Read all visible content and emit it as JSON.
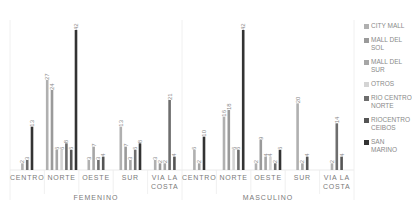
{
  "chart_data": {
    "type": "bar",
    "title": "",
    "xlabel": "",
    "ylabel": "",
    "ylim": [
      0,
      45
    ],
    "grid": false,
    "legend_position": "right",
    "groups": [
      "FEMENINO",
      "MASCULINO"
    ],
    "categories": [
      "CENTRO",
      "NORTE",
      "OESTE",
      "SUR",
      "VIA LA COSTA"
    ],
    "series": [
      {
        "name": "CITY MALL",
        "color": "#b0b0b0",
        "values": {
          "FEMENINO": [
            2,
            27,
            3,
            13,
            3
          ],
          "MASCULINO": [
            6,
            16,
            2,
            20,
            2
          ]
        }
      },
      {
        "name": "MALL DEL SOL",
        "color": "#9a9a9a",
        "values": {
          "FEMENINO": [
            0,
            24,
            0,
            7,
            2
          ],
          "MASCULINO": [
            0,
            18,
            9,
            0,
            0
          ]
        }
      },
      {
        "name": "MALL DEL SUR",
        "color": "#a6a6a6",
        "values": {
          "FEMENINO": [
            0,
            6,
            7,
            3,
            2
          ],
          "MASCULINO": [
            2,
            0,
            4,
            2,
            0
          ]
        }
      },
      {
        "name": "OTROS",
        "color": "#d4d4d4",
        "values": {
          "FEMENINO": [
            0,
            6,
            0,
            0,
            0
          ],
          "MASCULINO": [
            0,
            6,
            4,
            0,
            0
          ]
        }
      },
      {
        "name": "RIO CENTRO NORTE",
        "color": "#6e6e6e",
        "values": {
          "FEMENINO": [
            3,
            8,
            3,
            6,
            21
          ],
          "MASCULINO": [
            0,
            6,
            2,
            0,
            14
          ]
        }
      },
      {
        "name": "RIOCENTRO CEIBOS",
        "color": "#555555",
        "values": {
          "FEMENINO": [
            0,
            6,
            4,
            0,
            4
          ],
          "MASCULINO": [
            0,
            0,
            0,
            4,
            4
          ]
        }
      },
      {
        "name": "SAN MARINO",
        "color": "#333333",
        "values": {
          "FEMENINO": [
            13,
            42,
            0,
            8,
            0
          ],
          "MASCULINO": [
            10,
            42,
            6,
            0,
            0
          ]
        }
      }
    ]
  },
  "legend": [
    {
      "label": "CITY MALL",
      "color": "#b0b0b0"
    },
    {
      "label": "MALL DEL SOL",
      "color": "#9a9a9a"
    },
    {
      "label": "MALL DEL SUR",
      "color": "#a6a6a6"
    },
    {
      "label": "OTROS",
      "color": "#d4d4d4"
    },
    {
      "label": "RIO CENTRO NORTE",
      "color": "#6e6e6e"
    },
    {
      "label": "RIOCENTRO CEIBOS",
      "color": "#555555"
    },
    {
      "label": "SAN MARINO",
      "color": "#333333"
    }
  ]
}
